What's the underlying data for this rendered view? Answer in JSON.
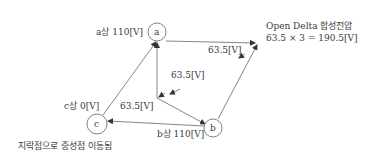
{
  "diagram": {
    "nodes": {
      "a": {
        "letter": "a",
        "label": "a상 110[V]"
      },
      "b": {
        "letter": "b",
        "label": "b상 110[V]"
      },
      "c": {
        "letter": "c",
        "label": "c상 0[V]"
      }
    },
    "edge_labels": {
      "upper_right": "63.5[V]",
      "middle": "63.5[V]",
      "lower_left": "63.5[V]"
    },
    "annotation": {
      "title": "Open Delta 합성전압",
      "formula": "63.5 × 3 = 190.5[V]"
    },
    "footnote": "지락점으로 중성점 이동됨"
  },
  "colors": {
    "line": "#555555",
    "text": "#3a3a3a"
  }
}
